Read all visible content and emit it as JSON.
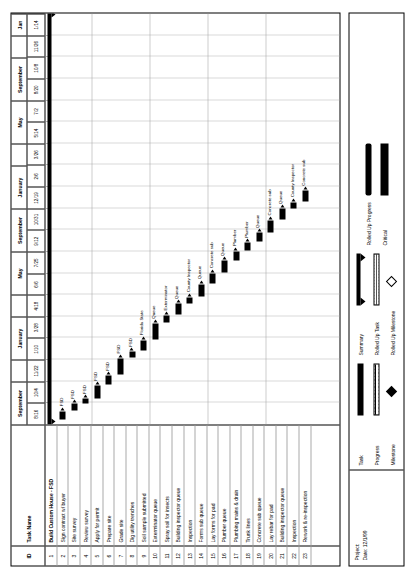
{
  "meta": {
    "project_label": "Project:",
    "date_label": "Date: 12/1/99"
  },
  "table": {
    "headers": {
      "id": "ID",
      "task_name": "Task Name"
    }
  },
  "timeline": {
    "months": [
      {
        "label": "September",
        "weeks": [
          "8/16",
          "10/4"
        ]
      },
      {
        "label": "",
        "weeks": [
          "11/22"
        ]
      },
      {
        "label": "January",
        "weeks": [
          "1/10",
          "3/28"
        ]
      },
      {
        "label": "",
        "weeks": [
          "4/18"
        ]
      },
      {
        "label": "May",
        "weeks": [
          "6/6",
          "7/25"
        ]
      },
      {
        "label": "September",
        "weeks": [
          "9/12",
          "10/31"
        ]
      },
      {
        "label": "January",
        "weeks": [
          "12/19",
          "2/6"
        ]
      },
      {
        "label": "",
        "weeks": [
          "3/26"
        ]
      },
      {
        "label": "May",
        "weeks": [
          "5/14",
          "7/2"
        ]
      },
      {
        "label": "September",
        "weeks": [
          "8/20",
          "10/8"
        ]
      },
      {
        "label": "",
        "weeks": [
          "11/26"
        ]
      },
      {
        "label": "Jan",
        "weeks": [
          "1/14"
        ]
      }
    ],
    "axis_start": "8/16",
    "axis_end": "1/14"
  },
  "chart_data": {
    "type": "bar",
    "title": "Build Custom House - FSD",
    "xlabel": "",
    "ylabel": "Task Name",
    "categories": [
      "Build Custom House - FSD",
      "Sign contract w/ buyer",
      "Site survey",
      "Review survey",
      "Apply for permit",
      "Prepare site",
      "Grade site",
      "Dig utility trenches",
      "Soil sample submitted",
      "Exterminator queue",
      "Spray soil for insects",
      "Building inspector queue",
      "Inspection",
      "Forms sub queue",
      "Lay forms for pad",
      "Plumber queue",
      "Plumbing mains & drain",
      "Trunk lines",
      "Concrete sub queue",
      "Lay rebar for pad",
      "Building inspector queue",
      "Inspection",
      "Rework & re-inspection"
    ],
    "tasks": [
      {
        "id": "1",
        "name": "Build Custom House - FSD",
        "kind": "summary",
        "start": 0.0,
        "end": 100.0,
        "label": ""
      },
      {
        "id": "2",
        "name": "Sign contract w/ buyer",
        "kind": "task",
        "start": 1.2,
        "end": 3.2,
        "label": "FSD"
      },
      {
        "id": "3",
        "name": "Site survey",
        "kind": "task",
        "start": 3.4,
        "end": 5.0,
        "label": "FSD"
      },
      {
        "id": "4",
        "name": "Review survey",
        "kind": "task",
        "start": 5.2,
        "end": 6.2,
        "label": "FSD"
      },
      {
        "id": "5",
        "name": "Apply for permit",
        "kind": "task",
        "start": 6.4,
        "end": 9.4,
        "label": "FSD"
      },
      {
        "id": "6",
        "name": "Prepare site",
        "kind": "task",
        "start": 9.6,
        "end": 11.8,
        "label": "FSD"
      },
      {
        "id": "7",
        "name": "Grade site",
        "kind": "task",
        "start": 12.0,
        "end": 16.0,
        "label": "FSD"
      },
      {
        "id": "8",
        "name": "Dig utility trenches",
        "kind": "task",
        "start": 16.2,
        "end": 17.6,
        "label": "FSD"
      },
      {
        "id": "9",
        "name": "Soil sample submitted",
        "kind": "task",
        "start": 17.8,
        "end": 20.4,
        "label": "Florida State"
      },
      {
        "id": "10",
        "name": "Exterminator queue",
        "kind": "task",
        "start": 20.6,
        "end": 24.4,
        "label": "Queue"
      },
      {
        "id": "11",
        "name": "Spray soil for insects",
        "kind": "task",
        "start": 24.6,
        "end": 26.4,
        "label": "Exterminator"
      },
      {
        "id": "12",
        "name": "Building inspector queue",
        "kind": "task",
        "start": 26.6,
        "end": 29.2,
        "label": "Queue"
      },
      {
        "id": "13",
        "name": "Inspection",
        "kind": "task",
        "start": 29.4,
        "end": 30.8,
        "label": "County Inspector"
      },
      {
        "id": "14",
        "name": "Forms sub queue",
        "kind": "task",
        "start": 31.0,
        "end": 34.0,
        "label": "Queue"
      },
      {
        "id": "15",
        "name": "Lay forms for pad",
        "kind": "task",
        "start": 34.2,
        "end": 36.6,
        "label": "Concrete sub"
      },
      {
        "id": "16",
        "name": "Plumber queue",
        "kind": "task",
        "start": 36.8,
        "end": 39.6,
        "label": "Queue"
      },
      {
        "id": "17",
        "name": "Plumbing mains & drain",
        "kind": "task",
        "start": 39.8,
        "end": 42.0,
        "label": "Plumber"
      },
      {
        "id": "18",
        "name": "Trunk lines",
        "kind": "task",
        "start": 42.2,
        "end": 44.0,
        "label": "Plumber"
      },
      {
        "id": "19",
        "name": "Concrete sub queue",
        "kind": "task",
        "start": 44.2,
        "end": 46.4,
        "label": "Queue"
      },
      {
        "id": "20",
        "name": "Lay rebar for pad",
        "kind": "task",
        "start": 46.6,
        "end": 49.4,
        "label": "Concrete sub"
      },
      {
        "id": "21",
        "name": "Building inspector queue",
        "kind": "task",
        "start": 49.6,
        "end": 52.2,
        "label": "Queue"
      },
      {
        "id": "22",
        "name": "Inspection",
        "kind": "task",
        "start": 52.4,
        "end": 53.8,
        "label": "County Inspector"
      },
      {
        "id": "23",
        "name": "Rework & re-inspection",
        "kind": "task",
        "start": 54.0,
        "end": 56.6,
        "label": "Concrete sub"
      }
    ]
  },
  "legend": {
    "columns": [
      {
        "items": [
          {
            "key": "Task",
            "symbol": "task-bar"
          },
          {
            "key": "Progress",
            "symbol": "progress-bar"
          },
          {
            "key": "Milestone",
            "symbol": "milestone-diamond"
          }
        ]
      },
      {
        "items": [
          {
            "key": "Summary",
            "symbol": "summary-bracket"
          },
          {
            "key": "Rolled Up Task",
            "symbol": "rolled-up-task-bar"
          },
          {
            "key": "Rolled Up Milestone",
            "symbol": "rolled-up-milestone-diamond"
          }
        ]
      },
      {
        "items": [
          {
            "key": "Rolled Up Progress",
            "symbol": "rolled-up-progress-bar"
          },
          {
            "key": "Critical",
            "symbol": "critical-bar"
          }
        ]
      }
    ]
  }
}
